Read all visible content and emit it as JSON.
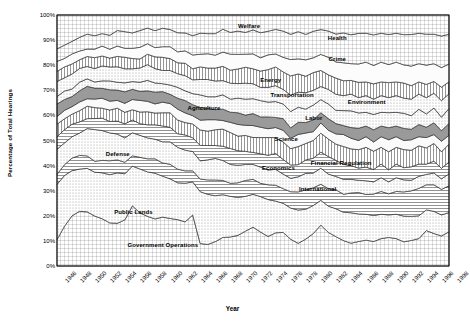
{
  "chart_data": {
    "type": "area",
    "title": "",
    "xlabel": "Year",
    "ylabel": "Percentage of Total Hearings",
    "ylim": [
      0,
      100
    ],
    "xlim": [
      1946,
      1998
    ],
    "grid": true,
    "stacked": true,
    "normalized": true,
    "legend_position": "inline-annotations",
    "ytick_labels": [
      "0%",
      "10%",
      "20%",
      "30%",
      "40%",
      "50%",
      "60%",
      "70%",
      "80%",
      "90%",
      "100%"
    ],
    "ytick_values": [
      0,
      10,
      20,
      30,
      40,
      50,
      60,
      70,
      80,
      90,
      100
    ],
    "xtick_labels": [
      "1946",
      "1948",
      "1950",
      "1952",
      "1954",
      "1956",
      "1958",
      "1960",
      "1962",
      "1964",
      "1966",
      "1968",
      "1970",
      "1972",
      "1974",
      "1976",
      "1978",
      "1980",
      "1982",
      "1984",
      "1986",
      "1988",
      "1990",
      "1992",
      "1994",
      "1996",
      "1998"
    ],
    "x": [
      1946,
      1947,
      1948,
      1949,
      1950,
      1951,
      1952,
      1953,
      1954,
      1955,
      1956,
      1957,
      1958,
      1959,
      1960,
      1961,
      1962,
      1963,
      1964,
      1965,
      1966,
      1967,
      1968,
      1969,
      1970,
      1971,
      1972,
      1973,
      1974,
      1975,
      1976,
      1977,
      1978,
      1979,
      1980,
      1981,
      1982,
      1983,
      1984,
      1985,
      1986,
      1987,
      1988,
      1989,
      1990,
      1991,
      1992,
      1993,
      1994,
      1995,
      1996,
      1997,
      1998
    ],
    "series": [
      {
        "name": "Government Operations",
        "fill": "#cfcfcf",
        "pattern": "grid",
        "values": [
          10.5,
          16.5,
          20.0,
          22.0,
          21.8,
          20.5,
          19.0,
          17.0,
          16.5,
          18.0,
          23.5,
          20.5,
          19.0,
          18.0,
          18.5,
          18.0,
          17.0,
          16.0,
          18.5,
          8.0,
          7.5,
          8.5,
          10.0,
          10.0,
          10.5,
          12.0,
          13.0,
          11.5,
          10.0,
          11.5,
          11.5,
          9.0,
          7.5,
          9.0,
          11.0,
          14.0,
          11.5,
          10.0,
          8.5,
          7.5,
          8.0,
          8.5,
          8.0,
          9.0,
          9.5,
          9.0,
          8.0,
          8.5,
          9.0,
          12.0,
          11.0,
          10.0,
          11.5
        ]
      },
      {
        "name": "Public Lands",
        "fill": "#efefef",
        "pattern": "dots",
        "values": [
          22.0,
          21.0,
          18.0,
          17.0,
          17.5,
          18.0,
          18.5,
          19.0,
          19.5,
          18.0,
          15.5,
          17.0,
          17.0,
          17.5,
          15.5,
          15.0,
          13.5,
          14.0,
          12.0,
          18.5,
          17.5,
          16.0,
          15.0,
          14.0,
          13.0,
          12.0,
          11.0,
          12.0,
          12.5,
          11.0,
          10.0,
          10.5,
          11.0,
          10.0,
          9.5,
          8.5,
          9.0,
          9.5,
          9.5,
          10.0,
          9.0,
          8.5,
          8.5,
          8.0,
          7.5,
          8.0,
          8.5,
          8.0,
          7.5,
          7.0,
          7.5,
          7.0,
          6.5
        ]
      },
      {
        "name": "International",
        "fill": "#ffffff",
        "pattern": "hlines",
        "values": [
          4.0,
          4.5,
          5.0,
          5.5,
          5.0,
          4.5,
          5.0,
          5.5,
          5.0,
          4.5,
          4.0,
          4.5,
          5.0,
          5.5,
          5.0,
          5.5,
          5.0,
          4.5,
          4.0,
          4.5,
          5.0,
          5.5,
          5.0,
          4.5,
          5.0,
          5.5,
          5.0,
          4.5,
          5.0,
          5.5,
          5.0,
          5.5,
          6.0,
          6.5,
          6.0,
          5.5,
          6.0,
          6.5,
          6.0,
          6.5,
          7.0,
          6.5,
          7.0,
          7.5,
          7.0,
          7.5,
          8.0,
          8.5,
          9.0,
          8.5,
          9.0,
          8.5,
          9.0
        ]
      },
      {
        "name": "Defense",
        "fill": "#f4f4f4",
        "pattern": "dots",
        "values": [
          10.0,
          9.0,
          8.5,
          9.0,
          11.0,
          13.0,
          12.0,
          11.0,
          10.0,
          9.5,
          9.0,
          8.5,
          8.0,
          7.5,
          8.0,
          8.5,
          8.0,
          7.5,
          7.0,
          6.5,
          7.0,
          7.5,
          7.0,
          6.5,
          6.0,
          5.5,
          5.0,
          5.5,
          5.0,
          5.5,
          5.0,
          4.5,
          5.0,
          5.5,
          5.0,
          5.5,
          5.0,
          4.5,
          5.0,
          4.5,
          4.0,
          4.5,
          4.0,
          4.5,
          4.0,
          4.5,
          4.0,
          3.5,
          4.0,
          3.5,
          4.0,
          3.5,
          4.0
        ]
      },
      {
        "name": "Economics",
        "fill": "#ffffff",
        "pattern": "hlines",
        "values": [
          5.0,
          5.5,
          5.0,
          4.5,
          4.0,
          4.5,
          5.0,
          4.5,
          5.0,
          5.5,
          5.0,
          4.5,
          5.0,
          5.5,
          6.0,
          5.5,
          5.0,
          5.5,
          5.0,
          5.5,
          5.0,
          4.5,
          5.0,
          5.5,
          5.0,
          4.5,
          4.0,
          4.5,
          5.0,
          5.5,
          5.0,
          4.5,
          4.0,
          4.5,
          5.0,
          5.5,
          6.0,
          5.5,
          5.0,
          4.5,
          4.0,
          4.5,
          4.0,
          4.5,
          4.0,
          4.5,
          4.0,
          4.5,
          4.0,
          3.5,
          4.0,
          3.5,
          4.0
        ]
      },
      {
        "name": "Financial Regulation",
        "fill": "#e4e4e4",
        "pattern": "vlines",
        "values": [
          5.0,
          4.5,
          4.0,
          4.5,
          5.0,
          4.5,
          4.0,
          4.5,
          5.0,
          4.5,
          4.0,
          4.5,
          5.0,
          4.5,
          5.0,
          5.5,
          5.0,
          4.5,
          5.0,
          5.5,
          5.0,
          5.5,
          6.0,
          5.5,
          5.0,
          5.5,
          5.0,
          5.5,
          6.0,
          5.5,
          6.0,
          5.5,
          6.0,
          5.5,
          6.0,
          6.5,
          6.0,
          5.5,
          6.0,
          5.5,
          6.0,
          6.5,
          6.0,
          5.5,
          6.0,
          5.5,
          6.0,
          5.5,
          6.0,
          5.5,
          6.0,
          5.5,
          6.0
        ]
      },
      {
        "name": "Science",
        "fill": "#fafafa",
        "pattern": "none",
        "values": [
          3.0,
          3.5,
          3.0,
          3.5,
          3.0,
          3.5,
          4.0,
          3.5,
          3.0,
          3.5,
          4.0,
          4.5,
          4.0,
          3.5,
          4.0,
          3.5,
          4.0,
          3.5,
          3.0,
          3.5,
          4.0,
          3.5,
          3.0,
          3.5,
          4.0,
          3.5,
          4.0,
          3.5,
          3.0,
          3.5,
          4.0,
          3.5,
          4.0,
          3.5,
          3.0,
          3.5,
          3.0,
          3.5,
          4.0,
          3.5,
          3.0,
          3.5,
          3.0,
          3.5,
          4.0,
          3.5,
          3.0,
          3.5,
          3.0,
          3.5,
          3.0,
          3.5,
          3.0
        ]
      },
      {
        "name": "Labor",
        "fill": "#9a9a9a",
        "pattern": "solid",
        "values": [
          5.0,
          4.5,
          4.0,
          4.5,
          5.0,
          4.5,
          4.0,
          4.5,
          4.0,
          4.5,
          4.0,
          3.5,
          4.0,
          4.5,
          4.0,
          3.5,
          4.0,
          4.5,
          4.0,
          4.5,
          4.0,
          3.5,
          4.0,
          3.5,
          4.0,
          3.5,
          4.0,
          3.5,
          4.0,
          3.5,
          4.0,
          3.5,
          4.0,
          3.5,
          4.0,
          3.5,
          4.0,
          3.5,
          3.0,
          3.5,
          4.0,
          3.5,
          4.0,
          3.5,
          4.0,
          3.5,
          4.0,
          3.5,
          4.0,
          3.5,
          4.0,
          3.5,
          4.0
        ]
      },
      {
        "name": "Environment",
        "fill": "#e9e9e9",
        "pattern": "dots",
        "values": [
          3.0,
          3.5,
          3.0,
          3.5,
          3.0,
          2.5,
          3.0,
          3.5,
          3.0,
          3.5,
          3.0,
          3.5,
          4.0,
          3.5,
          3.0,
          3.5,
          4.0,
          3.5,
          4.0,
          4.5,
          4.0,
          4.5,
          5.0,
          4.5,
          5.0,
          5.5,
          5.0,
          5.5,
          5.0,
          5.5,
          5.0,
          5.5,
          5.0,
          4.5,
          5.0,
          4.5,
          5.0,
          4.5,
          5.0,
          5.5,
          5.0,
          4.5,
          5.0,
          4.5,
          5.0,
          4.5,
          5.0,
          4.5,
          5.0,
          4.5,
          5.0,
          4.5,
          5.0
        ]
      },
      {
        "name": "Transportation",
        "fill": "#f2f2f2",
        "pattern": "dots",
        "values": [
          6.0,
          5.5,
          6.0,
          5.5,
          5.0,
          5.5,
          6.0,
          5.5,
          6.0,
          5.5,
          5.0,
          5.5,
          6.0,
          5.5,
          5.0,
          5.5,
          5.0,
          5.5,
          5.0,
          5.5,
          6.0,
          5.5,
          5.0,
          5.5,
          5.0,
          5.5,
          5.0,
          4.5,
          5.0,
          5.5,
          5.0,
          5.5,
          5.0,
          5.5,
          5.0,
          4.5,
          5.0,
          5.5,
          5.0,
          5.5,
          5.0,
          5.5,
          5.0,
          5.5,
          5.0,
          5.5,
          5.0,
          5.5,
          5.0,
          5.5,
          5.0,
          5.5,
          5.0
        ]
      },
      {
        "name": "Energy",
        "fill": "#dcdcdc",
        "pattern": "vlines",
        "values": [
          4.0,
          4.5,
          4.0,
          3.5,
          4.0,
          4.5,
          4.0,
          3.5,
          4.0,
          4.5,
          4.0,
          3.5,
          4.0,
          4.5,
          5.0,
          4.5,
          4.0,
          4.5,
          4.0,
          4.5,
          4.0,
          4.5,
          5.0,
          4.5,
          5.0,
          5.5,
          5.0,
          5.5,
          6.0,
          6.5,
          6.0,
          6.5,
          6.0,
          5.5,
          6.0,
          5.5,
          5.0,
          5.5,
          5.0,
          4.5,
          5.0,
          4.5,
          5.0,
          4.5,
          5.0,
          4.5,
          5.0,
          4.5,
          4.0,
          4.5,
          4.0,
          4.5,
          4.0
        ]
      },
      {
        "name": "Crime",
        "fill": "#fcfcfc",
        "pattern": "none",
        "values": [
          4.0,
          3.5,
          4.0,
          3.5,
          3.0,
          3.5,
          4.0,
          3.5,
          4.0,
          3.5,
          4.0,
          4.5,
          4.0,
          3.5,
          4.0,
          4.5,
          4.0,
          4.5,
          5.0,
          4.5,
          5.0,
          4.5,
          5.0,
          5.5,
          5.0,
          4.5,
          5.0,
          4.5,
          5.0,
          4.5,
          5.0,
          5.5,
          5.0,
          5.5,
          5.0,
          5.5,
          6.0,
          5.5,
          6.0,
          5.5,
          6.0,
          6.5,
          6.0,
          6.5,
          6.0,
          6.5,
          6.0,
          6.5,
          6.0,
          6.5,
          6.0,
          6.5,
          6.0
        ]
      },
      {
        "name": "Health",
        "fill": "#e6e6e6",
        "pattern": "grid",
        "values": [
          5.0,
          5.5,
          5.0,
          5.5,
          6.0,
          5.5,
          5.0,
          5.5,
          6.0,
          6.5,
          6.0,
          6.5,
          6.0,
          6.5,
          7.0,
          6.5,
          7.0,
          6.5,
          7.0,
          7.5,
          7.0,
          7.5,
          8.0,
          7.5,
          8.0,
          7.5,
          8.0,
          8.5,
          8.0,
          8.5,
          9.0,
          8.5,
          9.0,
          8.5,
          9.0,
          8.5,
          9.0,
          9.5,
          10.0,
          9.5,
          10.0,
          9.5,
          10.0,
          9.5,
          10.0,
          9.5,
          10.0,
          10.5,
          10.0,
          10.5,
          10.0,
          10.5,
          10.0
        ]
      },
      {
        "name": "Welfare",
        "fill": "#ededed",
        "pattern": "grid",
        "values": [
          13.5,
          12.5,
          10.5,
          9.0,
          7.7,
          8.5,
          7.5,
          8.0,
          6.0,
          6.5,
          7.0,
          6.0,
          5.0,
          6.0,
          5.0,
          5.5,
          6.5,
          6.5,
          7.5,
          6.5,
          6.5,
          6.5,
          5.0,
          6.0,
          5.5,
          6.0,
          5.0,
          6.0,
          5.5,
          5.0,
          5.5,
          6.5,
          5.5,
          6.5,
          5.5,
          5.0,
          5.5,
          6.5,
          6.0,
          6.5,
          6.0,
          6.0,
          6.5,
          6.0,
          6.5,
          6.0,
          6.5,
          6.5,
          6.0,
          6.5,
          6.5,
          7.0,
          6.5
        ]
      }
    ],
    "area_labels": [
      {
        "text": "Government Operations",
        "x": 0.27,
        "y": 0.915
      },
      {
        "text": "Public Lands",
        "x": 0.195,
        "y": 0.785
      },
      {
        "text": "Defense",
        "x": 0.155,
        "y": 0.555
      },
      {
        "text": "Agriculture",
        "x": 0.375,
        "y": 0.37
      },
      {
        "text": "Economics",
        "x": 0.565,
        "y": 0.608
      },
      {
        "text": "International",
        "x": 0.665,
        "y": 0.695
      },
      {
        "text": "Financial Regulation",
        "x": 0.725,
        "y": 0.59
      },
      {
        "text": "Science",
        "x": 0.585,
        "y": 0.495
      },
      {
        "text": "Labor",
        "x": 0.655,
        "y": 0.41
      },
      {
        "text": "Environment",
        "x": 0.79,
        "y": 0.345
      },
      {
        "text": "Transportation",
        "x": 0.6,
        "y": 0.32
      },
      {
        "text": "Energy",
        "x": 0.545,
        "y": 0.26
      },
      {
        "text": "Crime",
        "x": 0.715,
        "y": 0.175
      },
      {
        "text": "Health",
        "x": 0.715,
        "y": 0.09
      },
      {
        "text": "Welfare",
        "x": 0.49,
        "y": 0.045
      }
    ]
  }
}
